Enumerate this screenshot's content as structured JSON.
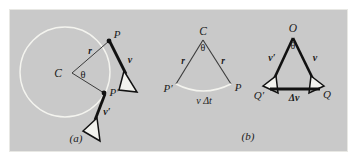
{
  "figure": {
    "background_color": "#ffffff",
    "panel_color": "#c9c9c9",
    "ink_color": "#1a1a1a",
    "arc_color": "#f2f2ee",
    "panels": [
      {
        "key": "a",
        "caption": "(a)"
      },
      {
        "key": "b",
        "caption": "(b)"
      }
    ]
  },
  "panel_a": {
    "caption": "(a)",
    "center_label": "C",
    "angle_label": "θ",
    "radius_label": "r",
    "point_p_label": "P",
    "point_p_prime_label": "P′",
    "velocity_label": "v",
    "velocity_prime_label": "v′",
    "circle": {
      "cx": 65,
      "cy": 72,
      "r": 45
    },
    "points": {
      "C": [
        72,
        73
      ],
      "P": [
        109,
        41
      ],
      "P_prime": [
        104,
        93
      ]
    }
  },
  "panel_b": {
    "caption": "(b)",
    "left_triangle": {
      "apex_label": "C",
      "angle_label": "θ",
      "radius_label_left": "r",
      "radius_label_right": "r",
      "base_left_label": "P′",
      "base_right_label": "P",
      "arc_label": "v Δt",
      "points": {
        "C": [
          203,
          36
        ],
        "P_prime": [
          176,
          84
        ],
        "P": [
          231,
          84
        ]
      }
    },
    "right_triangle": {
      "apex_label": "O",
      "angle_label": "θ",
      "side_label_left": "v′",
      "side_label_right": "v",
      "base_left_label": "Q′",
      "base_right_label": "Q",
      "base_label": "Δv",
      "points": {
        "O": [
          293,
          33
        ],
        "Q_prime": [
          268,
          88
        ],
        "Q": [
          320,
          88
        ]
      }
    }
  }
}
